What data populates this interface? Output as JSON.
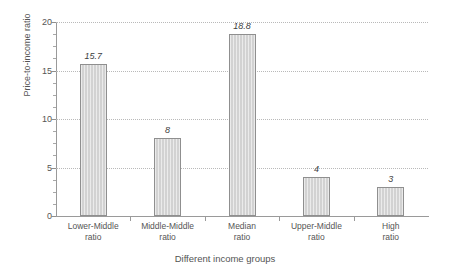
{
  "chart_data": {
    "type": "bar",
    "title": "",
    "xlabel": "Different income groups",
    "ylabel": "Price-to-income ratio",
    "categories": [
      "Lower-Middle ratio",
      "Middle-Middle ratio",
      "Median ratio",
      "Upper-Middle ratio",
      "High ratio"
    ],
    "category_lines": [
      [
        "Lower-Middle",
        "ratio"
      ],
      [
        "Middle-Middle",
        "ratio"
      ],
      [
        "Median",
        "ratio"
      ],
      [
        "Upper-Middle",
        "ratio"
      ],
      [
        "High",
        "ratio"
      ]
    ],
    "values": [
      15.7,
      8,
      18.8,
      4,
      3
    ],
    "value_labels": [
      "15.7",
      "8",
      "18.8",
      "4",
      "3"
    ],
    "ylim": [
      0,
      20
    ],
    "ytick_labels": [
      "0",
      "5",
      "10",
      "15",
      "20"
    ],
    "ytick_values": [
      0,
      5,
      10,
      15,
      20
    ],
    "yminor_step": 1.25,
    "grid": true,
    "grid_style": "dotted",
    "legend": "none",
    "bar_color": "#d2d2d2",
    "bar_border_color": "#8f8f8f",
    "grid_color": "#b9b9b9",
    "axis_color": "#9a9a9a",
    "text_color": "#545454",
    "background": "#ffffff"
  }
}
